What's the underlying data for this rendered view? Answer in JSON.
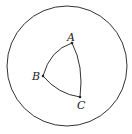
{
  "diagram": {
    "outer_circle": {
      "cx": 67,
      "cy": 66,
      "r": 60
    },
    "points": [
      {
        "label": "A",
        "x": 72,
        "y": 43
      },
      {
        "label": "B",
        "x": 43,
        "y": 76
      },
      {
        "label": "C",
        "x": 80,
        "y": 97
      }
    ],
    "stroke_color": "#333333"
  }
}
